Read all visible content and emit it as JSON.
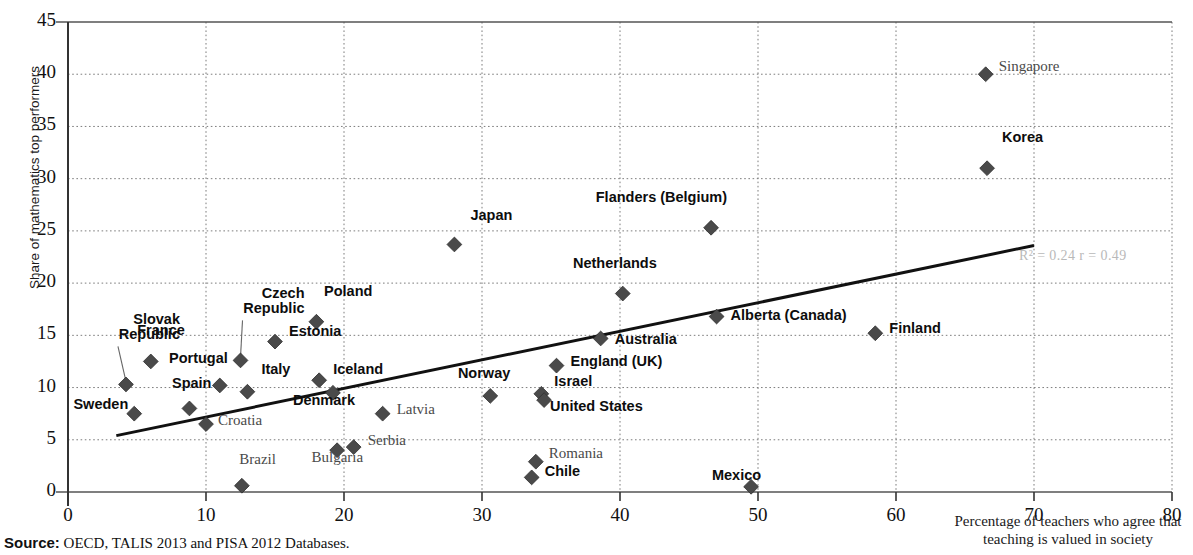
{
  "chart_data": {
    "type": "scatter",
    "title": "",
    "xlabel": "Percentage of teachers who agree that teaching is valued in society",
    "ylabel": "Share of mathematics top performers",
    "xlim": [
      0,
      80
    ],
    "ylim": [
      0,
      45
    ],
    "xticks": [
      0,
      10,
      20,
      30,
      40,
      50,
      60,
      70,
      80
    ],
    "yticks": [
      0,
      5,
      10,
      15,
      20,
      25,
      30,
      35,
      40,
      45
    ],
    "grid": "dotted-both",
    "legend": "none",
    "marker": "diamond",
    "marker_color": "#4a4a4a",
    "trendline": {
      "x0": 3.5,
      "y0": 5.4,
      "x1": 70.0,
      "y1": 23.6,
      "color": "#111111",
      "width": 3
    },
    "annotation": {
      "text": "R² = 0.24  r = 0.49",
      "r_squared": 0.24,
      "r": 0.49,
      "x": 70.5,
      "y": 22.6,
      "color": "#b9b9b9"
    },
    "points": [
      {
        "name": "Sweden",
        "x": 4.8,
        "y": 7.5,
        "style": "oecd",
        "label_dx": -84,
        "label_dy": -9,
        "lines": 1
      },
      {
        "name": "Slovak\nRepublic",
        "x": 4.2,
        "y": 10.3,
        "style": "oecd",
        "label_dx": -24,
        "label_dy": -64,
        "lines": 2,
        "leader": true
      },
      {
        "name": "France",
        "x": 6.0,
        "y": 12.5,
        "style": "oecd",
        "label_dx": -44,
        "label_dy": -30,
        "lines": 1
      },
      {
        "name": "Spain",
        "x": 8.8,
        "y": 8.0,
        "style": "oecd",
        "label_dx": -56,
        "label_dy": -24,
        "lines": 1
      },
      {
        "name": "Croatia",
        "x": 10.0,
        "y": 6.5,
        "style": "partner",
        "label_dx": 12,
        "label_dy": -3,
        "lines": 1
      },
      {
        "name": "Portugal",
        "x": 11.0,
        "y": 10.2,
        "style": "oecd",
        "label_dx": -70,
        "label_dy": -26,
        "lines": 1
      },
      {
        "name": "Brazil",
        "x": 12.6,
        "y": 0.6,
        "style": "partner",
        "label_dx": -44,
        "label_dy": -26,
        "lines": 1
      },
      {
        "name": "Czech\nRepublic",
        "x": 12.5,
        "y": 12.6,
        "style": "oecd",
        "label_dx": -14,
        "label_dy": -66,
        "lines": 2,
        "leader": true
      },
      {
        "name": "Italy",
        "x": 13.0,
        "y": 9.6,
        "style": "oecd",
        "label_dx": 14,
        "label_dy": -22,
        "lines": 1
      },
      {
        "name": "Estonia",
        "x": 15.0,
        "y": 14.4,
        "style": "oecd",
        "label_dx": 14,
        "label_dy": -10,
        "lines": 1
      },
      {
        "name": "Poland",
        "x": 18.0,
        "y": 16.3,
        "style": "oecd",
        "label_dx": -22,
        "label_dy": -30,
        "lines": 1
      },
      {
        "name": "Iceland",
        "x": 18.2,
        "y": 10.7,
        "style": "oecd",
        "label_dx": 14,
        "label_dy": -10,
        "lines": 1
      },
      {
        "name": "Denmark",
        "x": 19.2,
        "y": 9.5,
        "style": "oecd",
        "label_dx": -56,
        "label_dy": 8,
        "lines": 1
      },
      {
        "name": "Bulgaria",
        "x": 19.5,
        "y": 4.0,
        "style": "partner",
        "label_dx": -52,
        "label_dy": 8,
        "lines": 1
      },
      {
        "name": "Serbia",
        "x": 20.7,
        "y": 4.3,
        "style": "partner",
        "label_dx": 14,
        "label_dy": -6,
        "lines": 1
      },
      {
        "name": "Latvia",
        "x": 22.8,
        "y": 7.5,
        "style": "partner",
        "label_dx": 14,
        "label_dy": -4,
        "lines": 1
      },
      {
        "name": "Japan",
        "x": 28.0,
        "y": 23.7,
        "style": "oecd",
        "label_dx": -20,
        "label_dy": -28,
        "lines": 1
      },
      {
        "name": "Norway",
        "x": 30.6,
        "y": 9.2,
        "style": "oecd",
        "label_dx": -58,
        "label_dy": -22,
        "lines": 1
      },
      {
        "name": "Chile",
        "x": 33.6,
        "y": 1.4,
        "style": "oecd",
        "label_dx": 13,
        "label_dy": -5,
        "lines": 1
      },
      {
        "name": "Romania",
        "x": 33.9,
        "y": 2.9,
        "style": "partner",
        "label_dx": 13,
        "label_dy": -8,
        "lines": 1
      },
      {
        "name": "Israel",
        "x": 34.3,
        "y": 9.4,
        "style": "oecd",
        "label_dx": 13,
        "label_dy": -12,
        "lines": 1
      },
      {
        "name": "United States",
        "x": 34.5,
        "y": 8.8,
        "style": "oecd",
        "label_dx": 6,
        "label_dy": 7,
        "lines": 1
      },
      {
        "name": "England (UK)",
        "x": 35.4,
        "y": 12.1,
        "style": "oecd",
        "label_dx": 14,
        "label_dy": -4,
        "lines": 1
      },
      {
        "name": "Australia",
        "x": 38.6,
        "y": 14.7,
        "style": "oecd",
        "label_dx": 14,
        "label_dy": 2,
        "lines": 1
      },
      {
        "name": "Netherlands",
        "x": 40.2,
        "y": 19.0,
        "style": "oecd",
        "label_dx": -44,
        "label_dy": -30,
        "lines": 1
      },
      {
        "name": "Flanders (Belgium)",
        "x": 46.6,
        "y": 25.3,
        "style": "oecd",
        "label_dx": -62,
        "label_dy": -30,
        "lines": 1
      },
      {
        "name": "Alberta (Canada)",
        "x": 47.0,
        "y": 16.8,
        "style": "oecd",
        "label_dx": 14,
        "label_dy": -1,
        "lines": 1
      },
      {
        "name": "Mexico",
        "x": 49.5,
        "y": 0.5,
        "style": "oecd",
        "label_dx": -68,
        "label_dy": -11,
        "lines": 1
      },
      {
        "name": "Finland",
        "x": 58.5,
        "y": 15.2,
        "style": "oecd",
        "label_dx": 14,
        "label_dy": -4,
        "lines": 1
      },
      {
        "name": "Korea",
        "x": 66.6,
        "y": 31.0,
        "style": "oecd",
        "label_dx": -22,
        "label_dy": -30,
        "lines": 1
      },
      {
        "name": "Singapore",
        "x": 66.5,
        "y": 40.0,
        "style": "partner",
        "label_dx": 13,
        "label_dy": -7,
        "lines": 1
      }
    ]
  },
  "source": {
    "prefix": "Source:",
    "text": " OECD, TALIS 2013 and PISA 2012 Databases."
  }
}
